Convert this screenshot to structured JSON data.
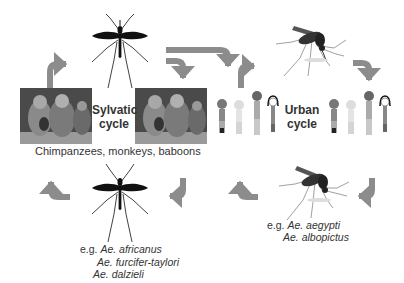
{
  "diagram": {
    "arrow_color": "#8c8c8c",
    "sylvatic": {
      "label_line1": "Sylvatic",
      "label_line2": "cycle",
      "hosts_caption": "Chimpanzees, monkeys, baboons",
      "vector_prefix": "e.g.",
      "vectors": [
        "Ae. africanus",
        "Ae. furcifer-taylori",
        "Ae. dalzieli"
      ],
      "images": [
        "primates-photo-left",
        "primates-photo-right",
        "sylvatic-mosquito-top",
        "sylvatic-mosquito-bottom"
      ]
    },
    "urban": {
      "label_line1": "Urban",
      "label_line2": "cycle",
      "vector_prefix": "e.g.",
      "vectors": [
        "Ae. aegypti",
        "Ae. albopictus"
      ],
      "images": [
        "human-figures-left",
        "human-figures-right",
        "urban-mosquito-top",
        "urban-mosquito-bottom"
      ]
    }
  }
}
